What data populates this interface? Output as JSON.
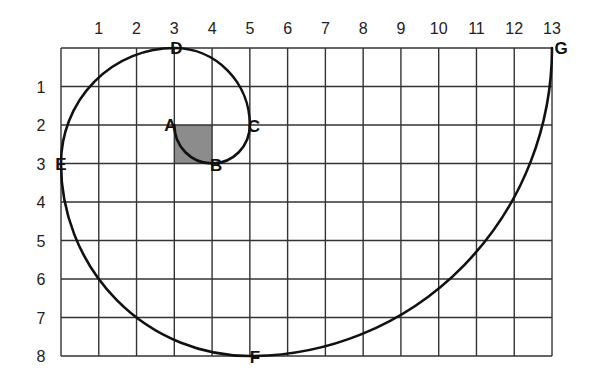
{
  "diagram": {
    "type": "golden-spiral-on-grid",
    "grid": {
      "columns": 13,
      "rows": 8,
      "x_tick_labels": [
        "1",
        "2",
        "3",
        "4",
        "5",
        "6",
        "7",
        "8",
        "9",
        "10",
        "11",
        "12",
        "13"
      ],
      "y_tick_labels": [
        "1",
        "2",
        "3",
        "4",
        "5",
        "6",
        "7",
        "8"
      ]
    },
    "shaded_square": {
      "x": 3,
      "y": 2,
      "size": 1,
      "color": "#8c8c8c"
    },
    "points": [
      {
        "label": "A",
        "x": 3,
        "y": 2
      },
      {
        "label": "B",
        "x": 4,
        "y": 3
      },
      {
        "label": "C",
        "x": 5,
        "y": 2
      },
      {
        "label": "D",
        "x": 3,
        "y": 0
      },
      {
        "label": "E",
        "x": 0,
        "y": 3
      },
      {
        "label": "F",
        "x": 5,
        "y": 8
      },
      {
        "label": "G",
        "x": 13,
        "y": 0
      }
    ],
    "curve_color": "#111111",
    "grid_color": "#333333"
  }
}
